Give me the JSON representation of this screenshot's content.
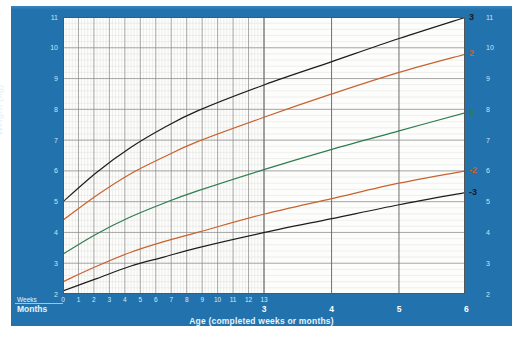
{
  "chart_data": {
    "type": "line",
    "title": "",
    "xlabel": "Age (completed weeks or months)",
    "ylabel": "Weight (kg)",
    "ylim": [
      2,
      11
    ],
    "xlim": [
      0,
      26
    ],
    "grid": true,
    "legend_position": "right-axis-labels",
    "y_ticks": [
      "2",
      "3",
      "4",
      "5",
      "6",
      "7",
      "8",
      "9",
      "10",
      "11"
    ],
    "x_axis_rows": [
      {
        "name": "Weeks",
        "label": "Weeks",
        "ticks": [
          "0",
          "1",
          "2",
          "3",
          "4",
          "5",
          "6",
          "7",
          "8",
          "9",
          "10",
          "11",
          "12",
          "13"
        ],
        "tick_weeks": [
          0,
          1,
          2,
          3,
          4,
          5,
          6,
          7,
          8,
          9,
          10,
          11,
          12,
          13
        ]
      },
      {
        "name": "Months",
        "label": "Months",
        "ticks": [
          "3",
          "4",
          "5",
          "6"
        ],
        "tick_weeks": [
          13,
          17.37,
          21.73,
          26.09
        ]
      }
    ],
    "series": [
      {
        "name": "3",
        "label": "3",
        "color": "#1c1c1c",
        "x_weeks": [
          0,
          2.17,
          4.35,
          6.52,
          8.7,
          13.04,
          17.39,
          21.74,
          26.09
        ],
        "values": [
          5.0,
          5.95,
          6.75,
          7.4,
          7.95,
          8.8,
          9.55,
          10.3,
          11.0
        ]
      },
      {
        "name": "2",
        "label": "2",
        "color": "#c8622e",
        "x_weeks": [
          0,
          2.17,
          4.35,
          6.52,
          8.7,
          13.04,
          17.39,
          21.74,
          26.09
        ],
        "values": [
          4.4,
          5.2,
          5.9,
          6.45,
          6.95,
          7.75,
          8.5,
          9.2,
          9.8
        ]
      },
      {
        "name": "0",
        "label": "0",
        "color": "#2e7d4f",
        "x_weeks": [
          0,
          2.17,
          4.35,
          6.52,
          8.7,
          13.04,
          17.39,
          21.74,
          26.09
        ],
        "values": [
          3.3,
          3.95,
          4.5,
          4.95,
          5.35,
          6.05,
          6.7,
          7.3,
          7.9
        ]
      },
      {
        "name": "-2",
        "label": "-2",
        "color": "#c8622e",
        "x_weeks": [
          0,
          2.17,
          4.35,
          6.52,
          8.7,
          13.04,
          17.39,
          21.74,
          26.09
        ],
        "values": [
          2.4,
          2.9,
          3.35,
          3.7,
          4.0,
          4.6,
          5.1,
          5.6,
          6.0
        ]
      },
      {
        "name": "-3",
        "label": "-3",
        "color": "#1c1c1c",
        "x_weeks": [
          0,
          2.17,
          4.35,
          6.52,
          8.7,
          13.04,
          17.39,
          21.74,
          26.09
        ],
        "values": [
          2.1,
          2.5,
          2.9,
          3.2,
          3.5,
          4.0,
          4.45,
          4.9,
          5.3
        ]
      }
    ]
  },
  "axis": {
    "y_title": "Weight (kg)",
    "x_title": "Age (completed weeks or months)",
    "weeks_row_label": "Weeks",
    "months_row_label": "Months"
  },
  "colors": {
    "panel": "#2272ad",
    "plot_bg": "#fdfdfb",
    "z3": "#1c1c1c",
    "z2": "#c8622e",
    "z0": "#2e7d4f",
    "grid_minor": "#d9d9d9",
    "grid_major": "#8a8a8a",
    "axis_text": "#cfe2f0"
  }
}
